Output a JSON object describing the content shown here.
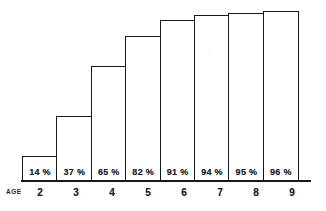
{
  "chart_data": {
    "type": "bar",
    "title": "",
    "xlabel": "AGE",
    "ylabel": "",
    "ylim": [
      0,
      100
    ],
    "grid": false,
    "legend": false,
    "categories": [
      "2",
      "3",
      "4",
      "5",
      "6",
      "7",
      "8",
      "9"
    ],
    "values": [
      14,
      37,
      65,
      82,
      91,
      94,
      95,
      96
    ],
    "data_labels": [
      "14 %",
      "37 %",
      "65 %",
      "82 %",
      "91 %",
      "94 %",
      "95 %",
      "96 %"
    ],
    "bars": [
      {
        "category": "2",
        "value": 14,
        "label": "14 %"
      },
      {
        "category": "3",
        "value": 37,
        "label": "37 %"
      },
      {
        "category": "4",
        "value": 65,
        "label": "65 %"
      },
      {
        "category": "5",
        "value": 82,
        "label": "82 %"
      },
      {
        "category": "6",
        "value": 91,
        "label": "91 %"
      },
      {
        "category": "7",
        "value": 94,
        "label": "94 %"
      },
      {
        "category": "8",
        "value": 95,
        "label": "95 %"
      },
      {
        "category": "9",
        "value": 96,
        "label": "96 %"
      }
    ]
  },
  "axis": {
    "age_caption": "AGE"
  },
  "colors": {
    "outline": "#17181a",
    "bar_fill": "#ffffff",
    "text": "#1b1c1e",
    "background": "#ffffff"
  }
}
